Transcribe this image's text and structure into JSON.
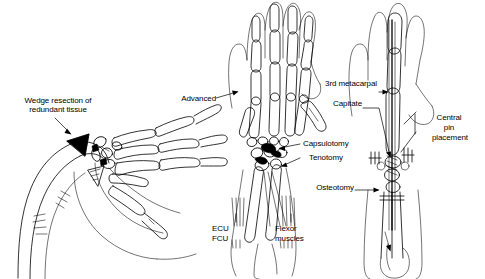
{
  "figure": {
    "background_color": "#ffffff",
    "ink_color": "#000000",
    "panels": [
      {
        "id": "panel-left",
        "name": "wedge-resection-panel",
        "description": "Lateral view of radially deviated wrist and hand skeleton with shaded wedge of redundant tissue"
      },
      {
        "id": "panel-middle",
        "name": "advancement-capsulotomy-panel",
        "description": "Dorsal view of hand and forearm skeleton showing tendon advancement, capsulotomy and tenotomy"
      },
      {
        "id": "panel-right",
        "name": "central-pin-placement-panel",
        "description": "Dorsal view of hand silhouette with central pin through third metacarpal and capitate, and forearm osteotomy"
      }
    ]
  },
  "labels": {
    "wedge_resection": "Wedge resection of\nredundant tissue",
    "wedge_resection_line1": "Wedge resection of",
    "wedge_resection_line2": "redundant tissue",
    "advanced": "Advanced",
    "capsulotomy": "Capsulotomy",
    "tenotomy": "Tenotomy",
    "ecu": "ECU",
    "fcu": "FCU",
    "flexor_line1": "Flexor",
    "flexor_line2": "muscles",
    "third_metacarpal": "3rd metacarpal",
    "capitate": "Capitate",
    "central_line1": "Central",
    "central_line2": "pin",
    "central_line3": "placement",
    "osteotomy": "Osteotomy"
  },
  "icons": {
    "arrowhead": "arrow-head-icon",
    "leader": "leader-line-icon"
  },
  "colors": {
    "ink": "#000000",
    "background": "#ffffff",
    "shaded_wedge": "#000000"
  }
}
